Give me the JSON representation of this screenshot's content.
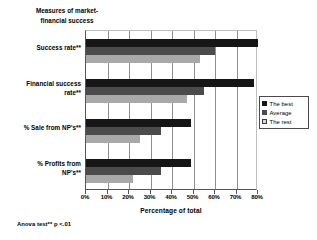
{
  "chart_data": {
    "type": "bar",
    "orientation": "horizontal",
    "title": "Measures of market-\nfinancial success",
    "xlabel": "Percentage of total",
    "ylabel": "",
    "xlim": [
      0,
      80
    ],
    "xtick_labels": [
      "0%",
      "10%",
      "20%",
      "30%",
      "40%",
      "50%",
      "60%",
      "70%",
      "80%"
    ],
    "xtick_values": [
      0,
      10,
      20,
      30,
      40,
      50,
      60,
      70,
      80
    ],
    "grid": "vertical",
    "legend_position": "right",
    "categories": [
      "Success rate**",
      "Financial success\nrate**",
      "% Sale from NP's**",
      "% Profits from\nNP's**"
    ],
    "series": [
      {
        "name": "The best",
        "color": "#161616",
        "values": [
          80,
          78,
          49,
          49
        ]
      },
      {
        "name": "Average",
        "color": "#4b4b4b",
        "values": [
          60,
          55,
          35,
          35
        ]
      },
      {
        "name": "The rest",
        "color": "#a9a9a9",
        "values": [
          53,
          47,
          25,
          22
        ]
      }
    ],
    "footnote": "Anova test** p <.01"
  },
  "legend": {
    "items": [
      {
        "label": "The best"
      },
      {
        "label": "Average"
      },
      {
        "label": "The rest"
      }
    ]
  }
}
